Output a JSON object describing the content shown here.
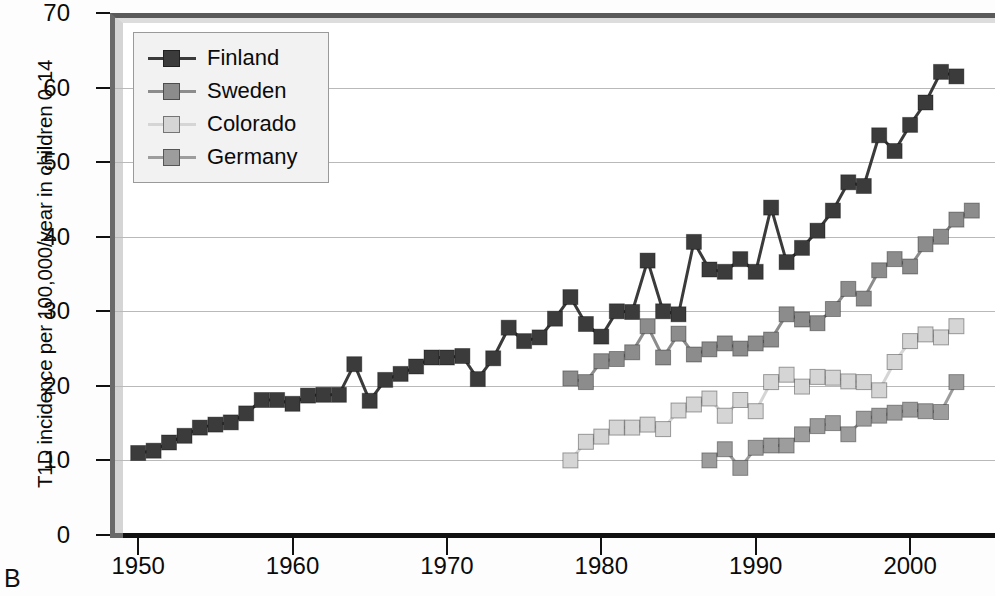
{
  "panel": {
    "label": "B"
  },
  "legend": {
    "position": "top-left inside axes",
    "entries": [
      {
        "label": "Finland",
        "color": "#3b3b3b"
      },
      {
        "label": "Sweden",
        "color": "#8c8c8c"
      },
      {
        "label": "Colorado",
        "color": "#d5d5d5"
      },
      {
        "label": "Germany",
        "color": "#9d9d9d"
      }
    ]
  },
  "axes": {
    "ylabel": "T1D incidence per 100,000/year in children 0-14",
    "xlabel": "",
    "yticks": [
      0,
      10,
      20,
      30,
      40,
      50,
      60,
      70
    ],
    "xticks": [
      1950,
      1960,
      1970,
      1980,
      1990,
      2000
    ],
    "ylim": [
      0,
      70
    ],
    "xlim": [
      1948.5,
      2005.5
    ]
  },
  "chart_data": {
    "type": "line",
    "title": "",
    "subtitle": "",
    "xlabel": "",
    "ylabel": "T1D incidence per 100,000/year in children 0-14",
    "xlim": [
      1948.5,
      2005.5
    ],
    "ylim": [
      0,
      70
    ],
    "grid": true,
    "legend_position": "top-left",
    "marker": "square",
    "series": [
      {
        "name": "Finland",
        "color": "#3b3b3b",
        "x": [
          1950,
          1951,
          1952,
          1953,
          1954,
          1955,
          1956,
          1957,
          1958,
          1959,
          1960,
          1961,
          1962,
          1963,
          1964,
          1965,
          1966,
          1967,
          1968,
          1969,
          1970,
          1971,
          1972,
          1973,
          1974,
          1975,
          1976,
          1977,
          1978,
          1979,
          1980,
          1981,
          1982,
          1983,
          1984,
          1985,
          1986,
          1987,
          1988,
          1989,
          1990,
          1991,
          1992,
          1993,
          1994,
          1995,
          1996,
          1997,
          1998,
          1999,
          2000,
          2001,
          2002,
          2003
        ],
        "values": [
          11.0,
          11.3,
          12.4,
          13.3,
          14.4,
          14.8,
          15.1,
          16.3,
          18.1,
          18.1,
          17.6,
          18.7,
          18.8,
          18.8,
          22.9,
          18.0,
          20.8,
          21.6,
          22.6,
          23.8,
          23.8,
          24.0,
          20.9,
          23.7,
          27.8,
          26.0,
          26.5,
          29.0,
          31.9,
          28.3,
          26.6,
          30.0,
          29.9,
          36.8,
          30.0,
          29.6,
          39.3,
          35.6,
          35.3,
          37.0,
          35.3,
          43.9,
          36.6,
          38.5,
          40.8,
          43.5,
          47.3,
          46.8,
          53.6,
          51.5,
          55.0,
          58.0,
          62.1,
          61.5
        ]
      },
      {
        "name": "Sweden",
        "color": "#8c8c8c",
        "x": [
          1978,
          1979,
          1980,
          1981,
          1982,
          1983,
          1984,
          1985,
          1986,
          1987,
          1988,
          1989,
          1990,
          1991,
          1992,
          1993,
          1994,
          1995,
          1996,
          1997,
          1998,
          1999,
          2000,
          2001,
          2002,
          2003,
          2004
        ],
        "values": [
          21.0,
          20.5,
          23.3,
          23.6,
          24.5,
          28.0,
          23.8,
          27.0,
          24.2,
          24.9,
          25.7,
          25.0,
          25.7,
          26.2,
          29.6,
          28.9,
          28.4,
          30.3,
          33.0,
          31.7,
          35.5,
          37.0,
          36.0,
          39.0,
          40.0,
          42.3,
          43.5
        ]
      },
      {
        "name": "Colorado",
        "color": "#d5d5d5",
        "x": [
          1978,
          1979,
          1980,
          1981,
          1982,
          1983,
          1984,
          1985,
          1986,
          1987,
          1988,
          1989,
          1990,
          1991,
          1992,
          1993,
          1994,
          1995,
          1996,
          1997,
          1998,
          1999,
          2000,
          2001,
          2002,
          2003
        ],
        "values": [
          10.0,
          12.5,
          13.2,
          14.4,
          14.4,
          14.8,
          14.2,
          16.7,
          17.5,
          18.3,
          16.0,
          18.1,
          16.6,
          20.5,
          21.5,
          19.9,
          21.2,
          21.1,
          20.6,
          20.5,
          19.4,
          23.2,
          26.0,
          26.9,
          26.5,
          28.0
        ]
      },
      {
        "name": "Germany",
        "color": "#9d9d9d",
        "x": [
          1987,
          1988,
          1989,
          1990,
          1991,
          1992,
          1993,
          1994,
          1995,
          1996,
          1997,
          1998,
          1999,
          2000,
          2001,
          2002,
          2003
        ],
        "values": [
          10.0,
          11.5,
          9.0,
          11.7,
          12.0,
          12.0,
          13.5,
          14.6,
          15.0,
          13.5,
          15.6,
          16.0,
          16.4,
          16.8,
          16.6,
          16.5,
          20.5
        ]
      }
    ]
  }
}
